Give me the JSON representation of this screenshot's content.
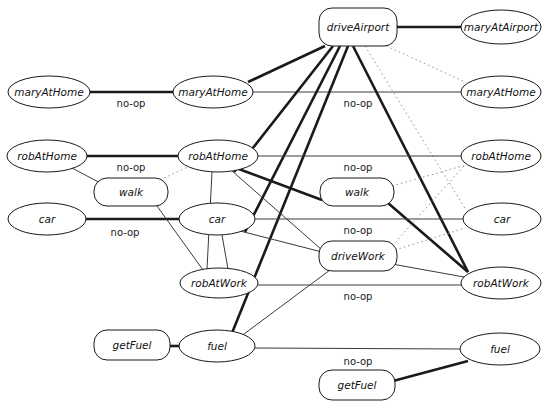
{
  "figure": {
    "type": "planning-graph-diagram",
    "background": "#ffffff",
    "stroke_color": "#1a1a1a",
    "caption": ""
  },
  "nodes": [
    {
      "id": "maryAtHome_L",
      "label": "maryAtHome",
      "shape": "ellipse",
      "cx": 49,
      "cy": 92,
      "rx": 41,
      "ry": 16
    },
    {
      "id": "maryAtHome_M",
      "label": "maryAtHome",
      "shape": "ellipse",
      "cx": 213,
      "cy": 92,
      "rx": 40,
      "ry": 16
    },
    {
      "id": "maryAtHome_R",
      "label": "maryAtHome",
      "shape": "ellipse",
      "cx": 501,
      "cy": 92,
      "rx": 40,
      "ry": 16
    },
    {
      "id": "driveAirport",
      "label": "driveAirport",
      "shape": "box",
      "cx": 358,
      "cy": 27,
      "rx": 39,
      "ry": 19
    },
    {
      "id": "maryAtAirport",
      "label": "maryAtAirport",
      "shape": "ellipse",
      "cx": 501,
      "cy": 27,
      "rx": 40,
      "ry": 17
    },
    {
      "id": "robAtHome_L",
      "label": "robAtHome",
      "shape": "ellipse",
      "cx": 47,
      "cy": 156,
      "rx": 40,
      "ry": 16
    },
    {
      "id": "robAtHome_M",
      "label": "robAtHome",
      "shape": "ellipse",
      "cx": 218,
      "cy": 156,
      "rx": 40,
      "ry": 16
    },
    {
      "id": "robAtHome_R",
      "label": "robAtHome",
      "shape": "ellipse",
      "cx": 501,
      "cy": 156,
      "rx": 40,
      "ry": 16
    },
    {
      "id": "walk_L",
      "label": "walk",
      "shape": "box",
      "cx": 131,
      "cy": 192,
      "rx": 37,
      "ry": 14
    },
    {
      "id": "walk_R",
      "label": "walk",
      "shape": "box",
      "cx": 357,
      "cy": 192,
      "rx": 37,
      "ry": 14
    },
    {
      "id": "car_L",
      "label": "car",
      "shape": "ellipse",
      "cx": 47,
      "cy": 219,
      "rx": 39,
      "ry": 16
    },
    {
      "id": "car_M",
      "label": "car",
      "shape": "ellipse",
      "cx": 217,
      "cy": 219,
      "rx": 38,
      "ry": 16
    },
    {
      "id": "car_R",
      "label": "car",
      "shape": "ellipse",
      "cx": 502,
      "cy": 219,
      "rx": 39,
      "ry": 16
    },
    {
      "id": "driveWork",
      "label": "driveWork",
      "shape": "box",
      "cx": 358,
      "cy": 256,
      "rx": 39,
      "ry": 15
    },
    {
      "id": "robAtWork_M",
      "label": "robAtWork",
      "shape": "ellipse",
      "cx": 219,
      "cy": 283,
      "rx": 39,
      "ry": 15
    },
    {
      "id": "robAtWork_R",
      "label": "robAtWork",
      "shape": "ellipse",
      "cx": 501,
      "cy": 283,
      "rx": 40,
      "ry": 16
    },
    {
      "id": "getFuel_M",
      "label": "getFuel",
      "shape": "box",
      "cx": 132,
      "cy": 345,
      "rx": 38,
      "ry": 15
    },
    {
      "id": "fuel_M",
      "label": "fuel",
      "shape": "ellipse",
      "cx": 217,
      "cy": 346,
      "rx": 38,
      "ry": 16
    },
    {
      "id": "fuel_R",
      "label": "fuel",
      "shape": "ellipse",
      "cx": 500,
      "cy": 349,
      "rx": 40,
      "ry": 16
    },
    {
      "id": "getFuel_B",
      "label": "getFuel",
      "shape": "box",
      "cx": 357,
      "cy": 385,
      "rx": 38,
      "ry": 15
    }
  ],
  "edges": [
    {
      "from": "maryAtHome_L",
      "to": "maryAtHome_M",
      "style": "thick",
      "x1": 90,
      "y1": 92,
      "x2": 173,
      "y2": 92
    },
    {
      "from": "maryAtHome_M",
      "to": "maryAtHome_R",
      "style": "thin",
      "x1": 253,
      "y1": 92,
      "x2": 461,
      "y2": 92
    },
    {
      "from": "driveAirport",
      "to": "maryAtAirport",
      "style": "thick",
      "x1": 397,
      "y1": 27,
      "x2": 461,
      "y2": 27
    },
    {
      "from": "driveAirport",
      "to": "maryAtHome_M",
      "style": "thick",
      "x1": 325,
      "y1": 46,
      "x2": 248,
      "y2": 82
    },
    {
      "from": "driveAirport",
      "to": "robAtHome_M",
      "style": "thick",
      "x1": 333,
      "y1": 46,
      "x2": 234,
      "y2": 172
    },
    {
      "from": "driveAirport",
      "to": "car_M",
      "style": "thick",
      "x1": 340,
      "y1": 46,
      "x2": 245,
      "y2": 232
    },
    {
      "from": "driveAirport",
      "to": "fuel_M",
      "style": "thick",
      "x1": 348,
      "y1": 46,
      "x2": 232,
      "y2": 333
    },
    {
      "from": "driveAirport",
      "to": "robAtWork_R",
      "style": "thick",
      "x1": 353,
      "y1": 46,
      "x2": 468,
      "y2": 272
    },
    {
      "from": "driveAirport",
      "to": "maryAtHome_R",
      "style": "dotted",
      "x1": 382,
      "y1": 44,
      "x2": 465,
      "y2": 82
    },
    {
      "from": "driveAirport",
      "to": "car_R",
      "style": "dotted",
      "x1": 365,
      "y1": 46,
      "x2": 466,
      "y2": 210
    },
    {
      "from": "robAtHome_L",
      "to": "robAtHome_M",
      "style": "thick",
      "x1": 87,
      "y1": 156,
      "x2": 178,
      "y2": 156
    },
    {
      "from": "robAtHome_M",
      "to": "robAtHome_R",
      "style": "thin",
      "x1": 258,
      "y1": 156,
      "x2": 461,
      "y2": 156
    },
    {
      "from": "robAtHome_L",
      "to": "walk_L",
      "style": "thin",
      "x1": 72,
      "y1": 168,
      "x2": 106,
      "y2": 186
    },
    {
      "from": "walk_L",
      "to": "robAtHome_M",
      "style": "dotted",
      "x1": 160,
      "y1": 180,
      "x2": 190,
      "y2": 166
    },
    {
      "from": "robAtHome_M",
      "to": "walk_R",
      "style": "thick",
      "x1": 236,
      "y1": 168,
      "x2": 322,
      "y2": 200
    },
    {
      "from": "robAtHome_M",
      "to": "driveWork",
      "style": "thin",
      "x1": 231,
      "y1": 170,
      "x2": 322,
      "y2": 250
    },
    {
      "from": "robAtHome_M",
      "to": "robAtWork_M",
      "style": "thin",
      "x1": 212,
      "y1": 172,
      "x2": 207,
      "y2": 269
    },
    {
      "from": "walk_R",
      "to": "robAtHome_R",
      "style": "dotted",
      "x1": 392,
      "y1": 186,
      "x2": 466,
      "y2": 165
    },
    {
      "from": "walk_R",
      "to": "robAtWork_R",
      "style": "thick",
      "x1": 388,
      "y1": 203,
      "x2": 468,
      "y2": 272
    },
    {
      "from": "car_L",
      "to": "car_M",
      "style": "thick",
      "x1": 85,
      "y1": 219,
      "x2": 180,
      "y2": 219
    },
    {
      "from": "car_M",
      "to": "car_R",
      "style": "thin",
      "x1": 255,
      "y1": 219,
      "x2": 463,
      "y2": 219
    },
    {
      "from": "walk_L",
      "to": "robAtWork_M",
      "style": "thin",
      "x1": 157,
      "y1": 206,
      "x2": 203,
      "y2": 270
    },
    {
      "from": "car_M",
      "to": "driveWork",
      "style": "thin",
      "x1": 240,
      "y1": 231,
      "x2": 322,
      "y2": 252
    },
    {
      "from": "car_M",
      "to": "robAtWork_M",
      "style": "thin",
      "x1": 222,
      "y1": 235,
      "x2": 228,
      "y2": 269
    },
    {
      "from": "driveWork",
      "to": "robAtHome_R",
      "style": "dotted",
      "x1": 392,
      "y1": 246,
      "x2": 464,
      "y2": 166
    },
    {
      "from": "driveWork",
      "to": "car_R",
      "style": "dotted",
      "x1": 395,
      "y1": 250,
      "x2": 465,
      "y2": 228
    },
    {
      "from": "driveWork",
      "to": "robAtWork_R",
      "style": "thin",
      "x1": 392,
      "y1": 264,
      "x2": 464,
      "y2": 277
    },
    {
      "from": "robAtWork_M",
      "to": "robAtWork_R",
      "style": "thin",
      "x1": 258,
      "y1": 285,
      "x2": 461,
      "y2": 285
    },
    {
      "from": "driveWork",
      "to": "fuel_M",
      "style": "thin",
      "x1": 330,
      "y1": 270,
      "x2": 240,
      "y2": 337
    },
    {
      "from": "getFuel_M",
      "to": "fuel_M",
      "style": "thick",
      "x1": 170,
      "y1": 346,
      "x2": 180,
      "y2": 346
    },
    {
      "from": "fuel_M",
      "to": "fuel_R",
      "style": "thin",
      "x1": 255,
      "y1": 348,
      "x2": 460,
      "y2": 349
    },
    {
      "from": "fuel_R",
      "to": "getFuel_B",
      "style": "thick",
      "x1": 468,
      "y1": 361,
      "x2": 393,
      "y2": 381
    }
  ],
  "edge_labels": [
    {
      "text": "no-op",
      "x": 131,
      "y": 104
    },
    {
      "text": "no-op",
      "x": 358,
      "y": 104
    },
    {
      "text": "no-op",
      "x": 131,
      "y": 168
    },
    {
      "text": "no-op",
      "x": 358,
      "y": 168
    },
    {
      "text": "no-op",
      "x": 125,
      "y": 233
    },
    {
      "text": "no-op",
      "x": 358,
      "y": 231
    },
    {
      "text": "no-op",
      "x": 358,
      "y": 297
    },
    {
      "text": "no-op",
      "x": 358,
      "y": 362
    }
  ]
}
